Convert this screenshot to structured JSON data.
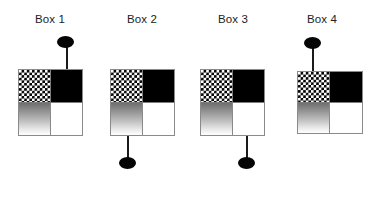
{
  "figure": {
    "width": 381,
    "height": 203,
    "background": "#ffffff"
  },
  "palette": {
    "checker_dark": "#000000",
    "checker_light": "#ffffff",
    "solid_black": "#000000",
    "solid_white": "#ffffff",
    "gradient_top": "#6f6f6f",
    "gradient_bottom": "#ffffff",
    "border": "#8a8a8a",
    "knob": "#050505",
    "stem": "#1a1a1a",
    "label_text": "#222222"
  },
  "quadrant_names": {
    "top_left": "checkerboard",
    "top_right": "solid-black",
    "bottom_left": "gradient-gray",
    "bottom_right": "solid-white"
  },
  "boxes": [
    {
      "id": "box-1",
      "label": "Box 1",
      "label_x": 28,
      "label_y": 13,
      "label_width": 44,
      "box_x": 18,
      "box_y": 69,
      "box_width": 65,
      "box_height": 67,
      "stem_direction": "up",
      "stem_attach_quadrant": "top_right",
      "stem_x": 66,
      "stem_y": 46,
      "stem_length": 24,
      "knob_x": 57,
      "knob_y": 36,
      "knob_width": 17,
      "knob_height": 12
    },
    {
      "id": "box-2",
      "label": "Box 2",
      "label_x": 120,
      "label_y": 13,
      "label_width": 44,
      "box_x": 110,
      "box_y": 69,
      "box_width": 65,
      "box_height": 67,
      "stem_direction": "down",
      "stem_attach_quadrant": "bottom_left",
      "stem_x": 127,
      "stem_y": 136,
      "stem_length": 23,
      "knob_x": 119,
      "knob_y": 157,
      "knob_width": 17,
      "knob_height": 12
    },
    {
      "id": "box-3",
      "label": "Box 3",
      "label_x": 211,
      "label_y": 13,
      "label_width": 44,
      "box_x": 200,
      "box_y": 69,
      "box_width": 65,
      "box_height": 67,
      "stem_direction": "down",
      "stem_attach_quadrant": "bottom_right",
      "stem_x": 246,
      "stem_y": 136,
      "stem_length": 23,
      "knob_x": 238,
      "knob_y": 157,
      "knob_width": 17,
      "knob_height": 12
    },
    {
      "id": "box-4",
      "label": "Box 4",
      "label_x": 300,
      "label_y": 13,
      "label_width": 44,
      "box_x": 297,
      "box_y": 71,
      "box_width": 66,
      "box_height": 63,
      "stem_direction": "up",
      "stem_attach_quadrant": "top_left",
      "stem_x": 312,
      "stem_y": 48,
      "stem_length": 24,
      "knob_x": 304,
      "knob_y": 37,
      "knob_width": 17,
      "knob_height": 12
    }
  ]
}
